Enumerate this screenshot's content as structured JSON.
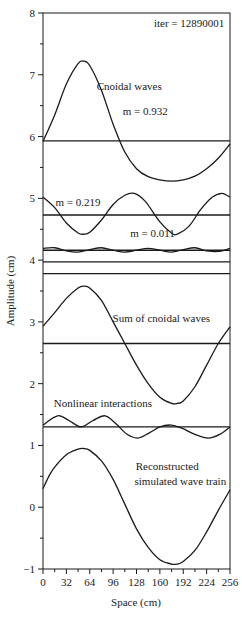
{
  "chart_data": {
    "type": "line",
    "title": "",
    "xlabel": "Space (cm)",
    "ylabel": "Amplitude (cm)",
    "xlim": [
      0,
      256
    ],
    "ylim": [
      -1,
      8
    ],
    "x_ticks": [
      0,
      32,
      64,
      96,
      128,
      160,
      192,
      224,
      256
    ],
    "x_tick_labels": [
      "0",
      "32",
      "64",
      "96",
      "128",
      "160",
      "192",
      "224",
      "256"
    ],
    "y_ticks": [
      -1,
      0,
      1,
      2,
      3,
      4,
      5,
      6,
      7,
      8
    ],
    "y_tick_labels": [
      "−1",
      "0",
      "1",
      "2",
      "3",
      "4",
      "5",
      "6",
      "7",
      "8"
    ],
    "grid": false,
    "annotations": [
      {
        "text": "iter = 12890001",
        "x": 200,
        "y": 7.78
      },
      {
        "text": "Cnoidal waves",
        "x": 118,
        "y": 6.75
      },
      {
        "text": "m = 0.932",
        "x": 140,
        "y": 6.35
      },
      {
        "text": "m = 0.219",
        "x": 48,
        "y": 4.88
      },
      {
        "text": "m = 0.011",
        "x": 150,
        "y": 4.37
      },
      {
        "text": "Sum of cnoidal waves",
        "x": 162,
        "y": 3.0
      },
      {
        "text": "Nonlinear interactions",
        "x": 82,
        "y": 1.63
      },
      {
        "text": "Reconstructed",
        "x": 170,
        "y": 0.6
      },
      {
        "text": "simulated wave train",
        "x": 188,
        "y": 0.36
      }
    ],
    "series": [
      {
        "name": "Cnoidal wave m=0.932",
        "x": [
          0,
          16,
          32,
          48,
          56,
          64,
          80,
          96,
          112,
          128,
          144,
          160,
          176,
          192,
          208,
          224,
          240,
          256
        ],
        "values": [
          5.92,
          6.35,
          6.85,
          7.18,
          7.22,
          7.15,
          6.75,
          6.2,
          5.75,
          5.48,
          5.35,
          5.3,
          5.28,
          5.3,
          5.36,
          5.48,
          5.65,
          5.88
        ]
      },
      {
        "name": "Cnoidal m=0.932 mean level",
        "x": [
          0,
          256
        ],
        "values": [
          5.93,
          5.93
        ]
      },
      {
        "name": "Cnoidal wave m=0.219",
        "x": [
          0,
          16,
          32,
          48,
          56,
          64,
          80,
          96,
          112,
          125,
          140,
          160,
          176,
          184,
          200,
          216,
          232,
          245,
          256
        ],
        "values": [
          5.02,
          4.85,
          4.6,
          4.44,
          4.42,
          4.45,
          4.65,
          4.9,
          5.05,
          5.08,
          4.95,
          4.62,
          4.44,
          4.42,
          4.55,
          4.82,
          5.02,
          5.08,
          5.02
        ]
      },
      {
        "name": "Cnoidal m=0.219 mean level",
        "x": [
          0,
          256
        ],
        "values": [
          4.73,
          4.73
        ]
      },
      {
        "name": "Cnoidal wave m=0.011",
        "x": [
          0,
          16,
          32,
          48,
          64,
          80,
          96,
          112,
          128,
          144,
          160,
          176,
          192,
          208,
          224,
          240,
          256
        ],
        "values": [
          4.19,
          4.2,
          4.15,
          4.13,
          4.17,
          4.2,
          4.16,
          4.13,
          4.16,
          4.19,
          4.16,
          4.13,
          4.17,
          4.2,
          4.15,
          4.14,
          4.19
        ]
      },
      {
        "name": "Cnoidal m=0.011 mean level",
        "x": [
          0,
          256
        ],
        "values": [
          4.16,
          4.16
        ]
      },
      {
        "name": "Reference line a",
        "x": [
          0,
          256
        ],
        "values": [
          3.97,
          3.97
        ]
      },
      {
        "name": "Reference line b",
        "x": [
          0,
          256
        ],
        "values": [
          3.78,
          3.78
        ]
      },
      {
        "name": "Sum of cnoidal waves",
        "x": [
          0,
          16,
          32,
          48,
          56,
          64,
          80,
          96,
          112,
          128,
          144,
          160,
          176,
          184,
          192,
          208,
          224,
          240,
          256
        ],
        "values": [
          2.93,
          3.15,
          3.38,
          3.55,
          3.58,
          3.55,
          3.35,
          3.0,
          2.65,
          2.3,
          2.0,
          1.78,
          1.68,
          1.68,
          1.72,
          1.95,
          2.3,
          2.65,
          2.92
        ]
      },
      {
        "name": "Sum mean level",
        "x": [
          0,
          256
        ],
        "values": [
          2.65,
          2.65
        ]
      },
      {
        "name": "Nonlinear interactions",
        "x": [
          0,
          20,
          36,
          52,
          68,
          85,
          100,
          115,
          130,
          145,
          160,
          175,
          190,
          208,
          226,
          242,
          256
        ],
        "values": [
          1.33,
          1.48,
          1.4,
          1.3,
          1.4,
          1.48,
          1.35,
          1.18,
          1.12,
          1.2,
          1.3,
          1.33,
          1.28,
          1.18,
          1.12,
          1.18,
          1.3
        ]
      },
      {
        "name": "Nonlinear mean level",
        "x": [
          0,
          256
        ],
        "values": [
          1.3,
          1.3
        ]
      },
      {
        "name": "Reconstructed simulated wave train",
        "x": [
          0,
          8,
          16,
          32,
          48,
          56,
          64,
          80,
          96,
          112,
          128,
          144,
          160,
          176,
          184,
          192,
          208,
          224,
          240,
          256
        ],
        "values": [
          0.3,
          0.5,
          0.65,
          0.85,
          0.94,
          0.95,
          0.92,
          0.75,
          0.45,
          0.05,
          -0.35,
          -0.65,
          -0.85,
          -0.92,
          -0.92,
          -0.88,
          -0.7,
          -0.4,
          -0.05,
          0.28
        ]
      }
    ]
  }
}
